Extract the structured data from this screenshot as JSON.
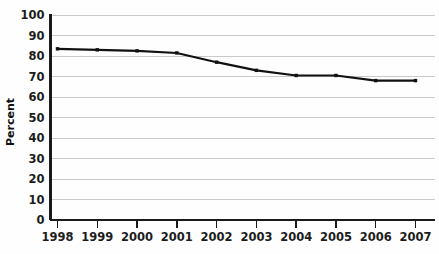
{
  "chart_data": {
    "type": "line",
    "title": "",
    "subtitle": "",
    "xlabel": "",
    "ylabel": "Percent",
    "categories": [
      "1998",
      "1999",
      "2000",
      "2001",
      "2002",
      "2003",
      "2004",
      "2005",
      "2006",
      "2007"
    ],
    "x": [
      1998,
      1999,
      2000,
      2001,
      2002,
      2003,
      2004,
      2005,
      2006,
      2007
    ],
    "values": [
      83.5,
      83.0,
      82.5,
      81.5,
      77.0,
      73.0,
      70.5,
      70.5,
      68.0,
      68.0
    ],
    "series": [
      {
        "name": "Percent",
        "values": [
          83.5,
          83.0,
          82.5,
          81.5,
          77.0,
          73.0,
          70.5,
          70.5,
          68.0,
          68.0
        ]
      }
    ],
    "ylim": [
      0,
      100
    ],
    "ytick_values": [
      0,
      10,
      20,
      30,
      40,
      50,
      60,
      70,
      80,
      90,
      100
    ],
    "ytick_labels": [
      "0",
      "10",
      "20",
      "30",
      "40",
      "50",
      "60",
      "70",
      "80",
      "90",
      "100"
    ],
    "xtick_labels": [
      "1998",
      "1999",
      "2000",
      "2001",
      "2002",
      "2003",
      "2004",
      "2005",
      "2006",
      "2007"
    ],
    "grid": true,
    "grid_axis": "y",
    "legend": false,
    "legend_position": "none",
    "marker": "square",
    "annotations": []
  },
  "style": {
    "background_color": "#fefefe",
    "grid_color": "#c9c9c9",
    "axis_color": "#1a1a1a",
    "line_color": "#111111",
    "marker_color": "#111111",
    "text_color": "#1c1c1c"
  }
}
